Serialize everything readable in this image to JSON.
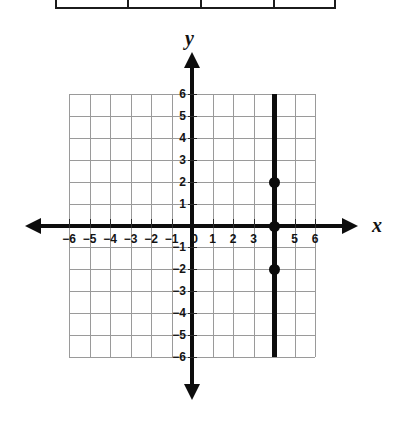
{
  "table_remnant": {
    "name": "partial-table-bottom-edge",
    "divider_x": [
      72,
      145,
      218
    ],
    "width": 281
  },
  "axes": {
    "x_letter": "x",
    "y_letter": "y"
  },
  "chart_data": {
    "type": "line",
    "title": "",
    "xlabel": "x",
    "ylabel": "y",
    "xlim": [
      -6,
      6
    ],
    "ylim": [
      -6,
      6
    ],
    "grid": true,
    "legend": "none",
    "x_tick_labels": [
      "−6",
      "−5",
      "−4",
      "−3",
      "−2",
      "−1",
      "0",
      "1",
      "2",
      "3",
      "",
      "5",
      "6"
    ],
    "x_tick_values": [
      -6,
      -5,
      -4,
      -3,
      -2,
      -1,
      0,
      1,
      2,
      3,
      4,
      5,
      6
    ],
    "y_tick_labels": [
      "6",
      "5",
      "4",
      "3",
      "2",
      "1",
      "0",
      "−1",
      "−2",
      "−3",
      "−4",
      "−5",
      "−6"
    ],
    "y_tick_values": [
      6,
      5,
      4,
      3,
      2,
      1,
      0,
      -1,
      -2,
      -3,
      -4,
      -5,
      -6
    ],
    "series": [
      {
        "name": "x = 4",
        "equation": "x = 4",
        "orientation": "vertical",
        "x": 4,
        "y_from": -6,
        "y_to": 6,
        "color": "#0d0d0d"
      }
    ],
    "points": [
      {
        "label": "(4, 2)",
        "x": 4,
        "y": 2
      },
      {
        "label": "(4, 0)",
        "x": 4,
        "y": 0
      },
      {
        "label": "(4, -2)",
        "x": 4,
        "y": -2
      }
    ],
    "colors": {
      "grid": "#9a9a9a",
      "axis": "#0d0d0d",
      "line": "#0d0d0d",
      "point": "#0b0b0b"
    }
  }
}
